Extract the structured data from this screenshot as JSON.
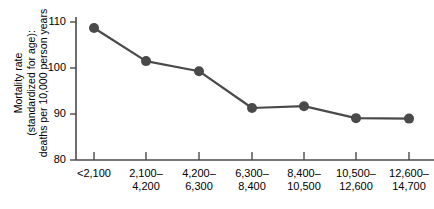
{
  "chart_data": {
    "type": "line",
    "title": "",
    "subtitle": "",
    "xlabel": "",
    "ylabel": "Mortality rate (standardized for age): deaths per 10,000 person years",
    "ylabel_lines": [
      "Mortality rate",
      "(standardized for age):",
      "deaths per 10,000 person years"
    ],
    "categories": [
      "<2,100",
      "2,100–4,200",
      "4,200–6,300",
      "6,300–8,400",
      "8,400–10,500",
      "10,500–12,600",
      "12,600–14,700"
    ],
    "category_lines": [
      [
        "<2,100"
      ],
      [
        "2,100–",
        "4,200"
      ],
      [
        "4,200–",
        "6,300"
      ],
      [
        "6,300–",
        "8,400"
      ],
      [
        "8,400–",
        "10,500"
      ],
      [
        "10,500–",
        "12,600"
      ],
      [
        "12,600–",
        "14,700"
      ]
    ],
    "values": [
      108.7,
      101.5,
      99.3,
      91.3,
      91.7,
      89.1,
      89.0
    ],
    "ylim": [
      80,
      112
    ],
    "yticks": [
      80,
      90,
      100,
      110
    ],
    "ytick_labels": [
      "80",
      "90",
      "100",
      "110"
    ],
    "grid": false,
    "legend": null,
    "series_color": "#4a4a4a",
    "axis_color": "#4a4a4a",
    "marker": "circle",
    "marker_size": 5,
    "line_width": 2.2
  }
}
